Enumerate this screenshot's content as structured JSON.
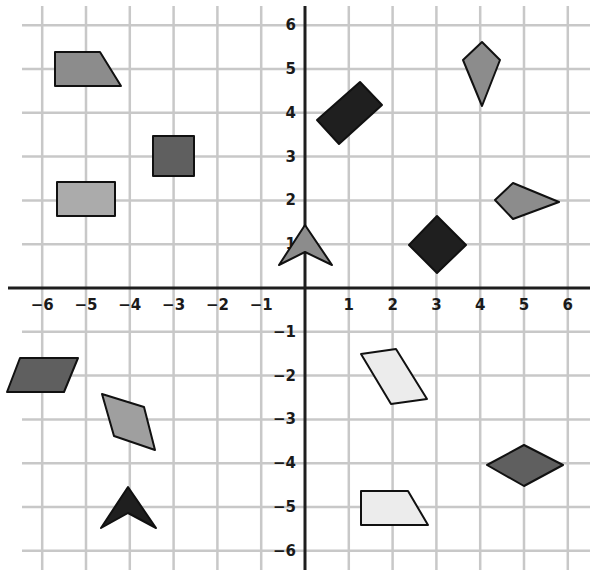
{
  "figure": {
    "grid": {
      "x_range": [
        -6,
        6
      ],
      "y_range": [
        -6,
        6
      ],
      "origin_px": [
        305,
        288
      ],
      "unit_px": 43.8,
      "grid_color": "#c8c8c8",
      "axis_color": "#1e1e1e"
    },
    "x_ticks": [
      {
        "value": -6,
        "label": "-6"
      },
      {
        "value": -5,
        "label": "-5"
      },
      {
        "value": -4,
        "label": "-4"
      },
      {
        "value": -3,
        "label": "-3"
      },
      {
        "value": -2,
        "label": "-2"
      },
      {
        "value": -1,
        "label": "-1"
      },
      {
        "value": 1,
        "label": "1"
      },
      {
        "value": 2,
        "label": "2"
      },
      {
        "value": 3,
        "label": "3"
      },
      {
        "value": 4,
        "label": "4"
      },
      {
        "value": 5,
        "label": "5"
      },
      {
        "value": 6,
        "label": "6"
      }
    ],
    "y_ticks": [
      {
        "value": 6,
        "label": "6"
      },
      {
        "value": 5,
        "label": "5"
      },
      {
        "value": 4,
        "label": "4"
      },
      {
        "value": 3,
        "label": "3"
      },
      {
        "value": 2,
        "label": "2"
      },
      {
        "value": 1,
        "label": "1"
      },
      {
        "value": -1,
        "label": "-1"
      },
      {
        "value": -2,
        "label": "-2"
      },
      {
        "value": -3,
        "label": "-3"
      },
      {
        "value": -4,
        "label": "-4"
      },
      {
        "value": -5,
        "label": "-5"
      },
      {
        "value": -6,
        "label": "-6"
      }
    ],
    "shapes": [
      {
        "name": "trapezoid",
        "quadrant": "II",
        "center": [
          -5,
          5
        ],
        "fill": "#8c8c8c",
        "points_px": "55,52 100,52 121,86 55,86"
      },
      {
        "name": "square",
        "quadrant": "II",
        "center": [
          -3,
          3
        ],
        "fill": "#5f5f5f",
        "points_px": "153,136 194,136 194,176 153,176"
      },
      {
        "name": "rectangle",
        "quadrant": "II",
        "center": [
          -5,
          2
        ],
        "fill": "#ababab",
        "points_px": "57,182 115,182 115,216 57,216"
      },
      {
        "name": "arrowhead",
        "quadrant": "I",
        "center": [
          0,
          1
        ],
        "fill": "#8c8c8c",
        "points_px": "305,225 332,265 305,252 279,265"
      },
      {
        "name": "rotated-rectangle",
        "quadrant": "I",
        "center": [
          1,
          4
        ],
        "fill": "#1f1f1f",
        "points_px": "317,120 360,82 382,105 339,144"
      },
      {
        "name": "kite-vertical",
        "quadrant": "I",
        "center": [
          4,
          5
        ],
        "fill": "#8c8c8c",
        "points_px": "482,42 500,60 482,106 463,60"
      },
      {
        "name": "kite-horizontal",
        "quadrant": "I",
        "center": [
          5,
          2
        ],
        "fill": "#8c8c8c",
        "points_px": "513,183 559,202 513,219 495,200"
      },
      {
        "name": "square-diamond",
        "quadrant": "I",
        "center": [
          3,
          1
        ],
        "fill": "#1f1f1f",
        "points_px": "437,216 466,245 437,273 409,245"
      },
      {
        "name": "parallelogram",
        "quadrant": "III",
        "center": [
          -6,
          -2
        ],
        "fill": "#5f5f5f",
        "points_px": "20,358 78,358 64,392 7,392"
      },
      {
        "name": "rhombus",
        "quadrant": "III",
        "center": [
          -4,
          -3
        ],
        "fill": "#9f9f9f",
        "points_px": "102,394 144,407 155,450 114,436"
      },
      {
        "name": "arrowhead",
        "quadrant": "III",
        "center": [
          -4,
          -5
        ],
        "fill": "#1f1f1f",
        "points_px": "128,487 156,528 128,513 101,528"
      },
      {
        "name": "parallelogram",
        "quadrant": "IV",
        "center": [
          2,
          -2
        ],
        "fill": "#ececec",
        "points_px": "361,354 396,349 427,399 391,404"
      },
      {
        "name": "rhombus",
        "quadrant": "IV",
        "center": [
          5,
          -4
        ],
        "fill": "#5f5f5f",
        "points_px": "524,445 563,465 524,486 487,465"
      },
      {
        "name": "trapezoid",
        "quadrant": "IV",
        "center": [
          2,
          -5
        ],
        "fill": "#ececec",
        "points_px": "361,491 408,491 428,525 361,525"
      }
    ]
  }
}
